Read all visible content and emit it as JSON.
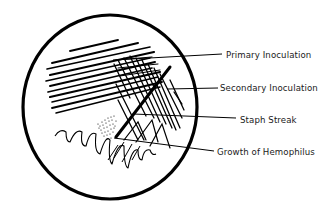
{
  "figure": {
    "colors": {
      "ink": "#000000",
      "background": "#ffffff",
      "label": "#1a1a1a"
    },
    "dish": {
      "cx": 110,
      "cy": 107,
      "rx": 88,
      "ry": 92
    },
    "labels": [
      {
        "id": "primary",
        "text": "Primary Inoculation",
        "x": 226,
        "y": 58,
        "leader": [
          113,
          60,
          222,
          54
        ]
      },
      {
        "id": "secondary",
        "text": "Secondary Inoculation",
        "x": 220,
        "y": 91,
        "leader": [
          167,
          89,
          218,
          88
        ]
      },
      {
        "id": "staph",
        "text": "Staph Streak",
        "x": 240,
        "y": 123,
        "leader": [
          133,
          114,
          236,
          118
        ]
      },
      {
        "id": "hemophilus",
        "text": "Growth of Hemophilus",
        "x": 217,
        "y": 155,
        "leader": [
          114,
          138,
          214,
          151
        ]
      }
    ]
  }
}
